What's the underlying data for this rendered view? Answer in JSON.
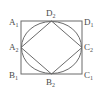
{
  "figure": {
    "background_color": "#ffffff",
    "stroke_color": "#6b6b6b",
    "label_color": "#4a4a4a",
    "outer_square": {
      "x": 21,
      "y": 21,
      "width": 61,
      "height": 53,
      "stroke_width": 1
    },
    "inscribed_circle": {
      "cx": 51.5,
      "cy": 47.5,
      "rx": 30.5,
      "ry": 26.5,
      "stroke_width": 1
    },
    "inscribed_diamond": {
      "points": "51.5,21 82,47.5 51.5,74 21,47.5",
      "stroke_width": 1
    }
  },
  "labels": {
    "top_left": {
      "name": "A",
      "sub": "1",
      "text": "A₁"
    },
    "top_center": {
      "name": "D",
      "sub": "2",
      "text": "D₂"
    },
    "top_right": {
      "name": "D",
      "sub": "1",
      "text": "D₁"
    },
    "left_middle": {
      "name": "A",
      "sub": "2",
      "text": "A₂"
    },
    "right_middle": {
      "name": "C",
      "sub": "2",
      "text": "C₂"
    },
    "bottom_left": {
      "name": "B",
      "sub": "1",
      "text": "B₁"
    },
    "bottom_center": {
      "name": "B",
      "sub": "2",
      "text": "B₂"
    },
    "bottom_right": {
      "name": "C",
      "sub": "1",
      "text": "C₁"
    }
  }
}
